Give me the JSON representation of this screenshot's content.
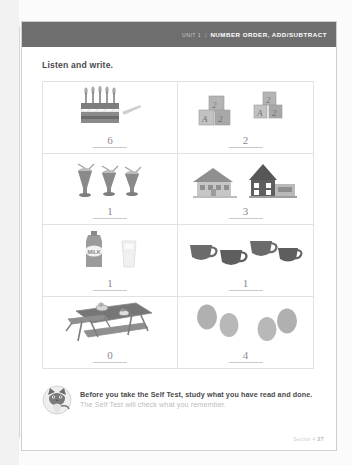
{
  "header": {
    "unit_label": "Unit 1",
    "separator": "|",
    "title": "NUMBER ORDER, ADD/SUBTRACT",
    "bar_color": "#6e6e6e"
  },
  "instruction": "Listen and write.",
  "exercises": [
    {
      "id": "cake-candles",
      "art": "birthday-cake-and-knife",
      "answer": "6"
    },
    {
      "id": "alphabet-blocks",
      "art": "alphabet-blocks-groups",
      "answer": "2"
    },
    {
      "id": "milkshakes",
      "art": "three-milkshakes",
      "answer": "1"
    },
    {
      "id": "houses",
      "art": "two-houses",
      "answer": "3"
    },
    {
      "id": "milk-and-glass",
      "art": "milk-carton-and-glass",
      "answer": "1"
    },
    {
      "id": "cups",
      "art": "four-cups",
      "answer": "1"
    },
    {
      "id": "picnic-table",
      "art": "picnic-table",
      "answer": "0"
    },
    {
      "id": "eggs",
      "art": "four-eggs",
      "answer": "4"
    }
  ],
  "footer": {
    "bold_text": "Before you take the Self Test, study what you have read and done.",
    "light_text": "The Self Test will check what you remember.",
    "mascot": "cat-mascot-icon"
  },
  "page_footer": {
    "section_label": "Section 4",
    "page_number": "27"
  },
  "labels": {
    "milk_carton": "MILK",
    "block_letters": [
      "A",
      "2"
    ]
  }
}
